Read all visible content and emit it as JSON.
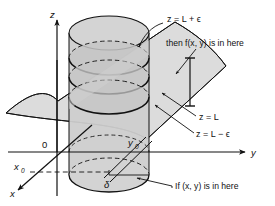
{
  "figure": {
    "axes": {
      "z_label": "z",
      "y_label": "y",
      "x_label": "x",
      "origin_label": "0"
    },
    "point_labels": {
      "x0": "x",
      "x0_sub": "0",
      "y0": "y",
      "y0_sub": "0",
      "delta": "δ"
    },
    "plane_labels": {
      "upper": "z = L + ϵ",
      "middle": "z = L",
      "lower": "z = L − ϵ"
    },
    "annotations": {
      "then": "then f(x, y) is in here",
      "then_prefix": "then ",
      "then_f": "f",
      "then_args": "(x, y)",
      "then_suffix": " is in here",
      "if": "If (x, y) is in here",
      "if_prefix": "If ",
      "if_args": "(x, y)",
      "if_suffix": " is in here"
    },
    "colors": {
      "ink": "#111111",
      "surface_fill": "#d8d8d8",
      "cylinder_fill": "#cfcfcf",
      "slice_fill": "#c4c4c4",
      "base_fill": "#d2d2d2",
      "background": "#ffffff"
    }
  }
}
